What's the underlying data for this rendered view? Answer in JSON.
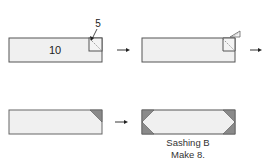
{
  "diagram": {
    "colors": {
      "fabric_fill": "#f0f0f0",
      "outline": "#555555",
      "corner_fill": "#8a8a8a",
      "arrow": "#222222",
      "background": "#ffffff"
    },
    "steps": [
      {
        "id": "step-1",
        "label_center": "10",
        "corner_square_label": "5",
        "description": "Rectangle 10 with square 5 placed on top-right corner, diagonal stitching line"
      },
      {
        "id": "step-2",
        "description": "Stitch diagonal and trim, fold corner back"
      },
      {
        "id": "step-3",
        "description": "Rectangle with pressed dark triangle on top-right corner"
      },
      {
        "id": "step-4",
        "description": "Rectangle with dark triangles on all four corners",
        "caption_line1": "Sashing B",
        "caption_line2": "Make 8."
      }
    ],
    "arrows": [
      {
        "from": "step-1",
        "to": "step-2"
      },
      {
        "from": "step-2",
        "to": "next"
      },
      {
        "from": "step-3",
        "to": "step-4"
      }
    ]
  }
}
